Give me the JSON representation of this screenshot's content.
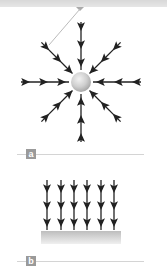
{
  "figure": {
    "panels": [
      {
        "label": "a",
        "description": "Radial field lines converging on a sphere",
        "directions": 8,
        "arrows_per_line": 3
      },
      {
        "label": "b",
        "description": "Uniform field lines pointing down onto a surface",
        "columns": 6,
        "rows": 3
      }
    ],
    "colors": {
      "arrow": "#222222",
      "sphere": "#cfcfcf",
      "label_box": "#9a9a9a",
      "rule": "#d4d4d4",
      "surface": "#c8c8c8"
    }
  }
}
